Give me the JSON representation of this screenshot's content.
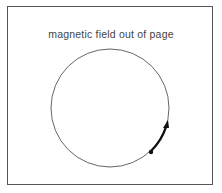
{
  "diagram": {
    "title": "magnetic field out of page",
    "circle": {
      "cx": 110,
      "cy": 108,
      "r": 59,
      "stroke": "#555555"
    },
    "particle": {
      "x": 151,
      "y": 152,
      "color": "#111111"
    },
    "velocity_arrow": {
      "direction": "counterclockwise",
      "color": "#111111"
    }
  }
}
